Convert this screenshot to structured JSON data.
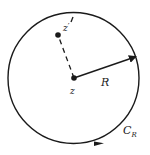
{
  "diagram": {
    "type": "contour-circle",
    "labels": {
      "center_point": "z",
      "interior_point": "z",
      "interior_prime": "′",
      "radius": "R",
      "contour": "C",
      "contour_sub": "R"
    },
    "colors": {
      "stroke": "#1a1a1a",
      "text": "#222222",
      "background": "#ffffff"
    }
  }
}
